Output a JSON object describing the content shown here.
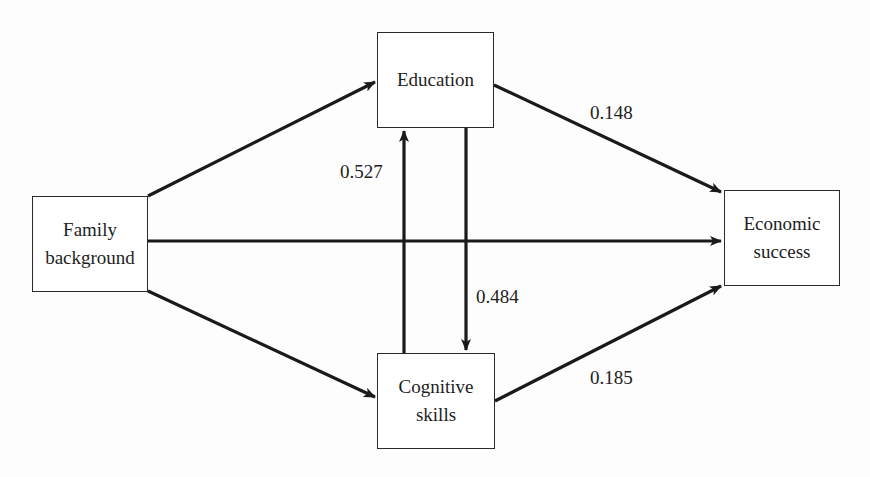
{
  "diagram": {
    "title": "",
    "nodes": {
      "education": {
        "lines": [
          "Education"
        ]
      },
      "family_background": {
        "lines": [
          "Family",
          "background"
        ]
      },
      "economic_success": {
        "lines": [
          "Economic",
          "success"
        ]
      },
      "cognitive_skills": {
        "lines": [
          "Cognitive",
          "skills"
        ]
      }
    },
    "edges": [
      {
        "from": "Family background",
        "to": "Education",
        "label": ""
      },
      {
        "from": "Family background",
        "to": "Economic success",
        "label": ""
      },
      {
        "from": "Family background",
        "to": "Cognitive skills",
        "label": ""
      },
      {
        "from": "Cognitive skills",
        "to": "Education",
        "label": "0.527"
      },
      {
        "from": "Education",
        "to": "Cognitive skills",
        "label": "0.484"
      },
      {
        "from": "Education",
        "to": "Economic success",
        "label": "0.148"
      },
      {
        "from": "Cognitive skills",
        "to": "Economic success",
        "label": "0.185"
      }
    ],
    "coefficients": {
      "cognitive_to_education": "0.527",
      "education_to_cognitive": "0.484",
      "education_to_economic": "0.148",
      "cognitive_to_economic": "0.185"
    },
    "colors": {
      "stroke": "#1a1a1a",
      "box_border": "#2a2a2a",
      "background": "#fdfdfd"
    }
  }
}
